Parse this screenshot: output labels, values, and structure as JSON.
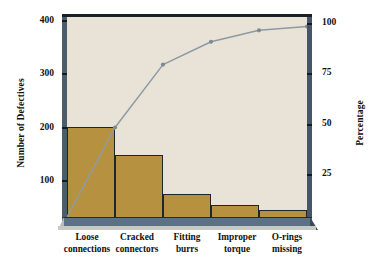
{
  "chart_data": {
    "type": "bar",
    "title": "",
    "subtitle": "",
    "categories": [
      "Loose connections",
      "Cracked connectors",
      "Fitting burrs",
      "Improper torque",
      "O-rings missing"
    ],
    "category_lines": [
      [
        "Loose",
        "connections"
      ],
      [
        "Cracked",
        "connectors"
      ],
      [
        "Fitting",
        "burrs"
      ],
      [
        "Improper",
        "torque"
      ],
      [
        "O-rings",
        "missing"
      ]
    ],
    "series": [
      {
        "name": "Number of Defectives",
        "type": "bar",
        "values": [
          190,
          130,
          48,
          25,
          15
        ],
        "axis": "left"
      },
      {
        "name": "Cumulative Percentage",
        "type": "line",
        "values": [
          47,
          80,
          92,
          98,
          100
        ],
        "axis": "right"
      }
    ],
    "xlabel": "",
    "ylabel": "Number of Defectives",
    "y2label": "Percentage",
    "ylim": [
      0,
      420
    ],
    "y2lim": [
      0,
      105
    ],
    "yticks": [
      100,
      200,
      300,
      400
    ],
    "ytick_labels": [
      "100",
      "200",
      "300",
      "400"
    ],
    "y2ticks": [
      25,
      50,
      75,
      100
    ],
    "y2tick_labels": [
      "25",
      "50",
      "75",
      "100"
    ],
    "grid": false,
    "legend": "none",
    "total_defectives": 408
  },
  "axes": {
    "left": {
      "title": "Number of Defectives",
      "ticks": [
        {
          "label": "400",
          "value": 400
        },
        {
          "label": "300",
          "value": 300
        },
        {
          "label": "200",
          "value": 200
        },
        {
          "label": "100",
          "value": 100
        }
      ]
    },
    "right": {
      "title": "Percentage",
      "ticks": [
        {
          "label": "100",
          "value": 100
        },
        {
          "label": "75",
          "value": 75
        },
        {
          "label": "50",
          "value": 50
        },
        {
          "label": "25",
          "value": 25
        }
      ]
    }
  },
  "colors": {
    "bar_fill": "#b69240",
    "bar_stroke": "#20252b",
    "plot_background": "#e9e3d7",
    "frame": "#4b5c6b",
    "frame_dark": "#1b2026",
    "base_slab": "#5d7185",
    "line": "#8e9aa3",
    "marker": "#7d8a94",
    "text": "#111111",
    "page_background": "#ffffff"
  }
}
